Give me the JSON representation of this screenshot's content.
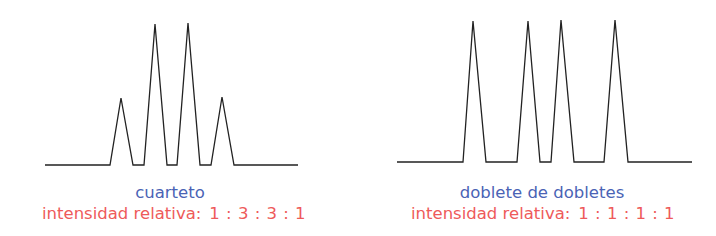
{
  "chart_data": [
    {
      "type": "line",
      "title": "cuarteto",
      "caption": "intensidad relativa:",
      "ratio": "1 : 3 : 3 : 1",
      "peaks": [
        1,
        3,
        3,
        1
      ],
      "peak_color": "#222222",
      "polyline": [
        [
          45,
          165
        ],
        [
          110,
          165
        ],
        [
          121,
          98
        ],
        [
          133,
          165
        ],
        [
          144,
          165
        ],
        [
          155,
          24
        ],
        [
          167,
          165
        ],
        [
          177,
          165
        ],
        [
          188,
          23
        ],
        [
          200,
          165
        ],
        [
          211,
          165
        ],
        [
          222,
          97
        ],
        [
          234,
          165
        ],
        [
          298,
          165
        ]
      ]
    },
    {
      "type": "line",
      "title": "doblete de dobletes",
      "caption": "intensidad relativa:",
      "ratio": "1 : 1 : 1 : 1",
      "peaks": [
        1,
        1,
        1,
        1
      ],
      "peak_color": "#222222",
      "polyline": [
        [
          397,
          162
        ],
        [
          463,
          162
        ],
        [
          473,
          21
        ],
        [
          486,
          162
        ],
        [
          517,
          162
        ],
        [
          528,
          21
        ],
        [
          540,
          162
        ],
        [
          551,
          162
        ],
        [
          561,
          20
        ],
        [
          574,
          162
        ],
        [
          604,
          162
        ],
        [
          615,
          20
        ],
        [
          628,
          162
        ],
        [
          692,
          162
        ]
      ]
    }
  ],
  "colors": {
    "title": "#4a63b5",
    "ratio": "#ee5a5a",
    "line": "#222222"
  },
  "left": {
    "title": "cuarteto",
    "caption": "intensidad relativa:",
    "ratio": "1 : 3 : 3 : 1"
  },
  "right": {
    "title": "doblete de dobletes",
    "caption": "intensidad relativa:",
    "ratio": "1 : 1 : 1 : 1"
  }
}
